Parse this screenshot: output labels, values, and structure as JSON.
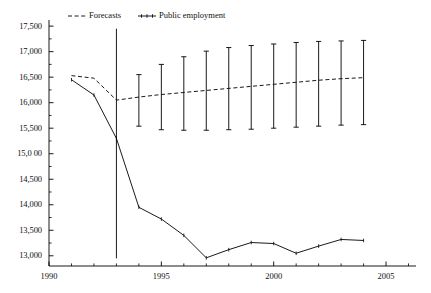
{
  "chart_data": {
    "type": "line",
    "title": "",
    "subtitle": "",
    "xlabel": "",
    "ylabel": "",
    "xlim": [
      1990,
      2006.2
    ],
    "ylim": [
      12800,
      17620
    ],
    "grid": false,
    "legend_position": "top-center",
    "x_ticks_major": [
      1990,
      1995,
      2000,
      2005
    ],
    "x_tick_labels": [
      "1990",
      "1995",
      "2000",
      "2005"
    ],
    "x_ticks_minor": [
      1991,
      1992,
      1993,
      1994,
      1996,
      1997,
      1998,
      1999,
      2001,
      2002,
      2003,
      2004,
      2006
    ],
    "y_ticks_major": [
      13000,
      13500,
      14000,
      14500,
      15000,
      15500,
      16000,
      16500,
      17000,
      17500
    ],
    "y_tick_labels": [
      "13,000",
      "13,500",
      "14,000",
      "14,500",
      "15,0 00",
      "15,500",
      "16,000",
      "16,500",
      "17,000",
      "17,500"
    ],
    "y_ticks_minor": [
      13250,
      13750,
      14250,
      14750,
      15250,
      15750,
      16250,
      16750,
      17250
    ],
    "legend": [
      {
        "name": "Forecasts",
        "style": "dashed",
        "marker": "none",
        "color": "#000000"
      },
      {
        "name": "Public employment",
        "style": "solid",
        "marker": "tick",
        "color": "#000000"
      }
    ],
    "series": [
      {
        "name": "Public employment",
        "style": "solid",
        "color": "#000000",
        "x": [
          1991,
          1992,
          1993,
          1994,
          1995,
          1996,
          1997,
          1998,
          1999,
          2000,
          2001,
          2002,
          2003,
          2004
        ],
        "values": [
          16450,
          16150,
          15300,
          13950,
          13720,
          13400,
          12960,
          13120,
          13260,
          13240,
          13050,
          13190,
          13320,
          13300
        ]
      },
      {
        "name": "Forecasts",
        "style": "dashed",
        "color": "#000000",
        "x": [
          1991,
          1992,
          1993,
          1994,
          1995,
          1996,
          1997,
          1998,
          1999,
          2000,
          2001,
          2002,
          2003,
          2004
        ],
        "values": [
          16530,
          16480,
          16050,
          16110,
          16160,
          16200,
          16240,
          16280,
          16320,
          16360,
          16400,
          16440,
          16470,
          16490
        ]
      }
    ],
    "error_bars": {
      "name": "Forecast confidence intervals",
      "color": "#000000",
      "x": [
        1993,
        1994,
        1995,
        1996,
        1997,
        1998,
        1999,
        2000,
        2001,
        2002,
        2003,
        2004
      ],
      "center": [
        16050,
        16110,
        16160,
        16200,
        16240,
        16280,
        16320,
        16360,
        16400,
        16440,
        16470,
        16490
      ],
      "upper": [
        17450,
        16550,
        16750,
        16900,
        17010,
        17080,
        17120,
        17150,
        17180,
        17200,
        17210,
        17220
      ],
      "lower": [
        12950,
        15540,
        15470,
        15460,
        15460,
        15470,
        15480,
        15500,
        15520,
        15540,
        15560,
        15570
      ]
    }
  }
}
